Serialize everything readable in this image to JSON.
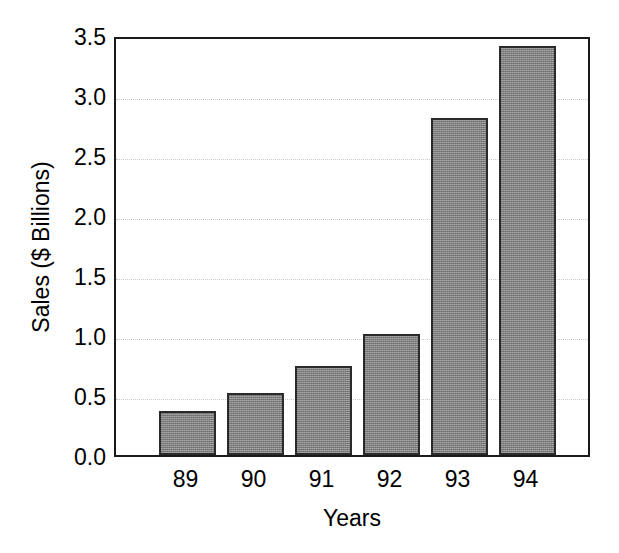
{
  "chart_data": {
    "type": "bar",
    "title": "",
    "xlabel": "Years",
    "ylabel": "Sales ($ Billions)",
    "categories": [
      "89",
      "90",
      "91",
      "92",
      "93",
      "94"
    ],
    "values": [
      0.37,
      0.52,
      0.74,
      1.01,
      2.81,
      3.41
    ],
    "ylim": [
      0.0,
      3.5
    ],
    "yticks": [
      "3.5",
      "3.0",
      "2.5",
      "2.0",
      "1.5",
      "1.0",
      "0.5",
      "0.0"
    ],
    "ytick_values": [
      3.5,
      3.0,
      2.5,
      2.0,
      1.5,
      1.0,
      0.5,
      0.0
    ],
    "grid": true,
    "grid_style": "dotted",
    "legend": "none",
    "bar_fill_color": "#7d7d7d",
    "bar_edge_color": "#2a2a2a",
    "axis_color": "#1a1a1a",
    "background_color": "#ffffff",
    "grid_color": "#c9c9c9"
  }
}
